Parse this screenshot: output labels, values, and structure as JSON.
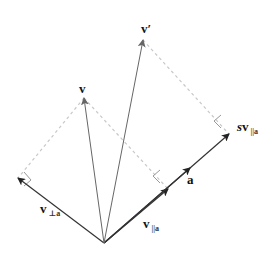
{
  "diagram": {
    "type": "vector-decomposition",
    "colors": {
      "vector": "#555555",
      "axis": "#333333",
      "dashed": "#c8c8c8",
      "right_angle": "#999999",
      "label": "#111111"
    },
    "origin": [
      104,
      243
    ],
    "vectors": [
      {
        "id": "v",
        "tip": [
          84,
          98
        ]
      },
      {
        "id": "v_prime",
        "tip": [
          143,
          40
        ]
      },
      {
        "id": "v_perp_a",
        "tip": [
          18,
          178
        ]
      },
      {
        "id": "s_v_par_a",
        "tip": [
          229,
          134
        ]
      },
      {
        "id": "v_par_a",
        "tip": [
          168,
          189
        ]
      },
      {
        "id": "a",
        "tip": [
          190,
          168
        ]
      }
    ],
    "labels": {
      "v": {
        "main": "v",
        "sub": ""
      },
      "v_prime": {
        "main": "v′",
        "sub": ""
      },
      "v_perp_a": {
        "main": "v",
        "sub": "⊥a"
      },
      "v_par_a": {
        "main": "v",
        "sub": "||a"
      },
      "s_v_par_a": {
        "prefix": "s",
        "main": "v",
        "sub": "||a"
      },
      "a": {
        "main": "a",
        "sub": ""
      }
    }
  }
}
